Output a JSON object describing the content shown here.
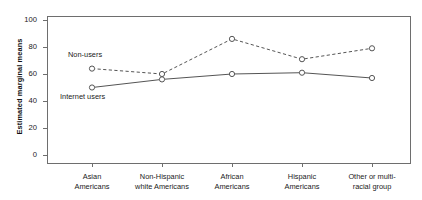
{
  "chart_data": {
    "type": "line",
    "title": "",
    "xlabel": "",
    "ylabel": "Estimated marginal means",
    "categories": [
      "Asian Americans",
      "Non-Hispanic white Americans",
      "African Americans",
      "Hispanic Americans",
      "Other or multi-racial group"
    ],
    "category_lines": [
      [
        "Asian",
        "Americans"
      ],
      [
        "Non-Hispanic",
        "white Americans"
      ],
      [
        "African",
        "Americans"
      ],
      [
        "Hispanic",
        "Americans"
      ],
      [
        "Other or multi-",
        "racial group"
      ]
    ],
    "series": [
      {
        "name": "Non-users",
        "style": "dashed",
        "marker": "open-circle",
        "color": "#555555",
        "values": [
          64,
          60,
          86,
          71,
          79
        ]
      },
      {
        "name": "Internet users",
        "style": "solid",
        "marker": "open-circle",
        "color": "#555555",
        "values": [
          50,
          56,
          60,
          61,
          57
        ]
      }
    ],
    "ylim": [
      0,
      100
    ],
    "yticks": [
      0,
      20,
      40,
      60,
      80,
      100
    ],
    "ytick_labels": [
      "0",
      "20",
      "40",
      "60",
      "80",
      "100"
    ],
    "grid": false,
    "legend": "inline-annotations",
    "annotations": [
      {
        "text": "Non-users",
        "series": "Non-users"
      },
      {
        "text": "Internet users",
        "series": "Internet users"
      }
    ]
  },
  "colors": {
    "axis": "#6e6e6e",
    "series": "#555555",
    "text": "#1a1a1a",
    "background": "#ffffff"
  }
}
